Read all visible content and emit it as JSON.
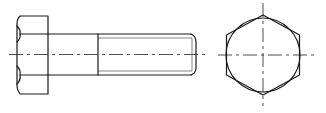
{
  "drawing": {
    "subject": "Hexagon head bolt",
    "views": [
      {
        "name": "side-view",
        "label": "Side view"
      },
      {
        "name": "end-view",
        "label": "End view (hexagon head)"
      }
    ],
    "colors": {
      "line": "#1a1a1a",
      "background": "#ffffff"
    }
  }
}
